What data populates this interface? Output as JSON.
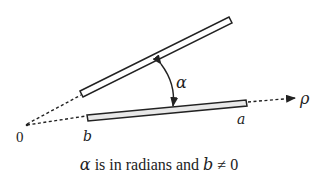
{
  "figure": {
    "labels": {
      "origin": "0",
      "alpha": "α",
      "rho": "ρ",
      "a": "a",
      "b": "b"
    },
    "caption": {
      "alpha": "α",
      "text1": " is in radians and ",
      "b": "b",
      "text2": " ≠ 0"
    },
    "colors": {
      "stroke": "#222222",
      "fill": "#ffffff"
    }
  }
}
